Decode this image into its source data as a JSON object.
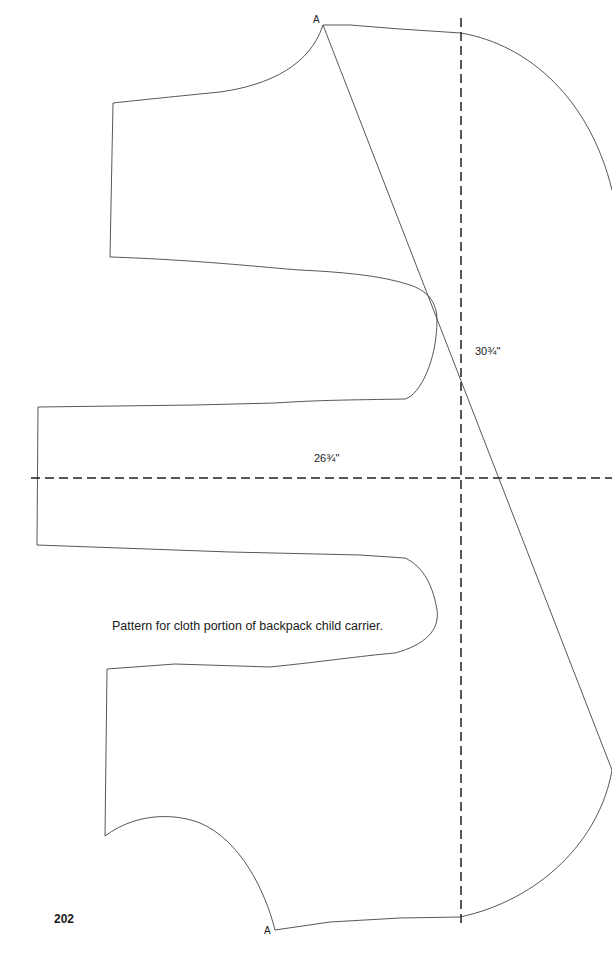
{
  "document": {
    "page_number": "202",
    "caption": "Pattern for cloth portion of backpack child carrier.",
    "point_labels": {
      "top": "A",
      "bottom": "A"
    },
    "dimensions": {
      "vertical": "30¾\"",
      "horizontal": "26¾\""
    },
    "colors": {
      "outline": "#444444",
      "dashed_line": "#222222",
      "text": "#1a1a1a",
      "background": "#ffffff"
    }
  }
}
